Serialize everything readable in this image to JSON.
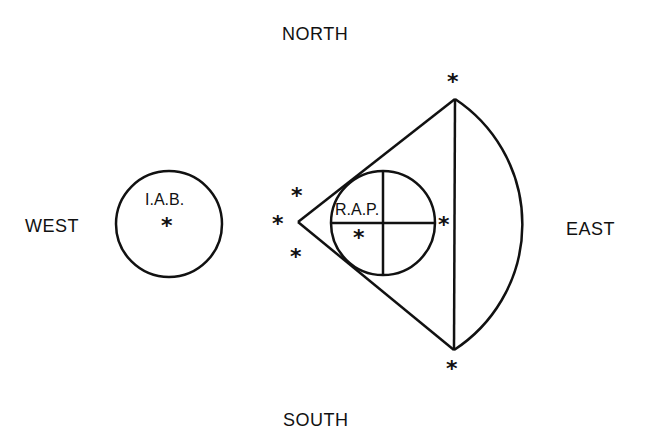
{
  "compass": {
    "north": "NORTH",
    "south": "SOUTH",
    "east": "EAST",
    "west": "WEST"
  },
  "regions": {
    "iab": {
      "label": "I.A.B.",
      "marker": "*"
    },
    "rap": {
      "label": "R.A.P.",
      "marker": "*"
    }
  },
  "markers": {
    "symbol": "*",
    "apex_upper": "*",
    "apex_left": "*",
    "apex_lower": "*",
    "top_vertex": "*",
    "bottom_vertex": "*",
    "chord_mid": "*"
  },
  "colors": {
    "stroke": "#111111",
    "background": "#ffffff"
  }
}
